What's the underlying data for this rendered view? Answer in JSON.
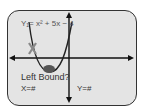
{
  "screen": {
    "equation": "Y₁= x² + 5x − 4",
    "prompt": "Left Bound?",
    "x_readout": "X=#",
    "y_readout": "Y=#",
    "cursor_marker": "X"
  },
  "colors": {
    "curve": "#222222",
    "axes": "#111111",
    "marker_x": "#8a8a8a",
    "point": "#555555",
    "screen_bg": "#e4e4e4",
    "border": "#333333"
  }
}
